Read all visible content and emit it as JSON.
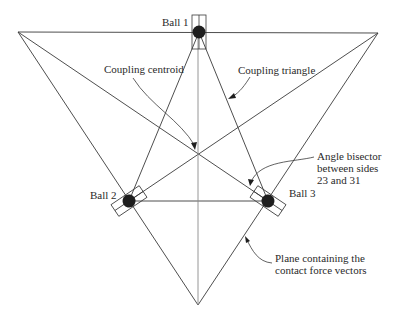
{
  "diagram": {
    "labels": {
      "ball1": "Ball 1",
      "ball2": "Ball 2",
      "ball3": "Ball 3",
      "centroid": "Coupling centroid",
      "triangle": "Coupling triangle",
      "bisector_line1": "Angle bisector",
      "bisector_line2": "between sides",
      "bisector_line3": "23 and 31",
      "plane_line1": "Plane containing the",
      "plane_line2": "contact force vectors"
    },
    "nodes": {
      "ball1": [
        199,
        32
      ],
      "ball2": [
        129,
        201
      ],
      "ball3": [
        268,
        201
      ],
      "centroid": [
        198,
        154
      ],
      "outer_top_left": [
        18,
        32
      ],
      "outer_top_right": [
        378,
        33
      ],
      "outer_bottom": [
        198,
        305
      ]
    },
    "colors": {
      "line": "#3a3a3a",
      "ball": "#1e1e1e",
      "background": "#ffffff"
    }
  }
}
